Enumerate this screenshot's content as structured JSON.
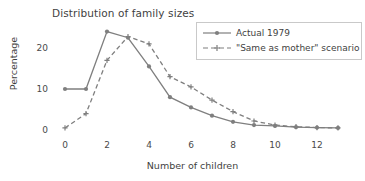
{
  "chart_data": {
    "type": "line",
    "title": "Distribution of family sizes",
    "xlabel": "Number of children",
    "ylabel": "Percentage",
    "x": [
      0,
      1,
      2,
      3,
      4,
      5,
      6,
      7,
      8,
      9,
      10,
      11,
      12,
      13
    ],
    "xlim": [
      0,
      13
    ],
    "ylim": [
      0,
      25
    ],
    "xticks": [
      "0",
      "2",
      "4",
      "6",
      "8",
      "10",
      "12"
    ],
    "xtick_values": [
      0,
      2,
      4,
      6,
      8,
      10,
      12
    ],
    "yticks": [
      "0",
      "10",
      "20"
    ],
    "ytick_values": [
      0,
      10,
      20
    ],
    "grid": false,
    "legend_position": "upper right",
    "series": [
      {
        "name": "Actual 1979",
        "linestyle": "solid",
        "marker": "circle",
        "color": "#7f7f7f",
        "values": [
          10.0,
          10.0,
          24.0,
          22.5,
          15.5,
          8.0,
          5.5,
          3.5,
          2.0,
          1.2,
          1.0,
          0.7,
          0.6,
          0.5
        ]
      },
      {
        "name": "\"Same as mother\" scenario",
        "linestyle": "dashed",
        "marker": "plus",
        "color": "#7f7f7f",
        "values": [
          0.5,
          4.0,
          17.0,
          22.8,
          21.0,
          13.0,
          10.5,
          7.3,
          4.5,
          2.2,
          1.2,
          0.8,
          0.6,
          0.5
        ]
      }
    ]
  },
  "legend": {
    "items": [
      {
        "label": "Actual 1979"
      },
      {
        "label": "\"Same as mother\" scenario"
      }
    ]
  },
  "colors": {
    "line": "#7f7f7f",
    "text": "#3f3f3f",
    "legend_border": "#c9c9c9",
    "background": "#ffffff"
  }
}
